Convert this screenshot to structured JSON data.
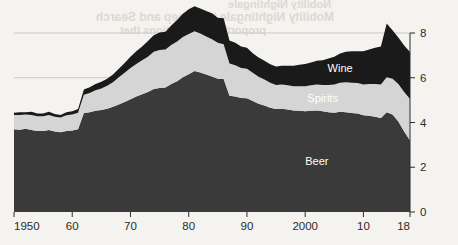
{
  "chart_data": {
    "type": "area",
    "stacked": true,
    "title": "",
    "subtitle": "",
    "xlabel": "",
    "ylabel": "",
    "xlim": [
      1950,
      2018
    ],
    "ylim": [
      0,
      8.6
    ],
    "y_axis_position": "right",
    "grid": "horizontal-faint",
    "gridlines": [
      6,
      8
    ],
    "legend_position": "inline-on-areas",
    "x_tick_labels": [
      "1950",
      "60",
      "70",
      "80",
      "90",
      "2000",
      "10",
      "18"
    ],
    "x_tick_values": [
      1950,
      1960,
      1970,
      1980,
      1990,
      2000,
      2010,
      2018
    ],
    "y_tick_labels": [
      "0",
      "2",
      "4",
      "6",
      "8"
    ],
    "y_tick_values": [
      0,
      2,
      4,
      6,
      8
    ],
    "x": [
      1950,
      1951,
      1952,
      1953,
      1954,
      1955,
      1956,
      1957,
      1958,
      1959,
      1960,
      1961,
      1962,
      1963,
      1964,
      1965,
      1966,
      1967,
      1968,
      1969,
      1970,
      1971,
      1972,
      1973,
      1974,
      1975,
      1976,
      1977,
      1978,
      1979,
      1980,
      1981,
      1982,
      1983,
      1984,
      1985,
      1986,
      1987,
      1988,
      1989,
      1990,
      1991,
      1992,
      1993,
      1994,
      1995,
      1996,
      1997,
      1998,
      1999,
      2000,
      2001,
      2002,
      2003,
      2004,
      2005,
      2006,
      2007,
      2008,
      2009,
      2010,
      2011,
      2012,
      2013,
      2014,
      2015,
      2016,
      2017,
      2018
    ],
    "series": [
      {
        "name": "Beer",
        "color": "#3a3a3a",
        "label_color": "#ffffff",
        "values": [
          3.7,
          3.68,
          3.72,
          3.66,
          3.62,
          3.62,
          3.66,
          3.6,
          3.56,
          3.62,
          3.64,
          3.7,
          4.42,
          4.46,
          4.52,
          4.56,
          4.62,
          4.7,
          4.8,
          4.92,
          5.04,
          5.16,
          5.26,
          5.36,
          5.5,
          5.54,
          5.56,
          5.72,
          5.84,
          6.02,
          6.16,
          6.3,
          6.24,
          6.14,
          6.06,
          5.96,
          5.94,
          5.2,
          5.16,
          5.1,
          5.08,
          4.96,
          4.84,
          4.76,
          4.66,
          4.6,
          4.62,
          4.58,
          4.54,
          4.52,
          4.5,
          4.52,
          4.54,
          4.5,
          4.46,
          4.44,
          4.48,
          4.46,
          4.42,
          4.4,
          4.32,
          4.3,
          4.26,
          4.2,
          4.46,
          4.36,
          4.04,
          3.6,
          3.2
        ]
      },
      {
        "name": "Spirits",
        "color": "#d5d5d5",
        "label_color": "#ffffff",
        "values": [
          0.64,
          0.66,
          0.64,
          0.68,
          0.66,
          0.66,
          0.68,
          0.66,
          0.66,
          0.7,
          0.72,
          0.74,
          0.82,
          0.86,
          0.92,
          0.96,
          1.02,
          1.1,
          1.22,
          1.3,
          1.4,
          1.46,
          1.52,
          1.58,
          1.66,
          1.7,
          1.7,
          1.74,
          1.78,
          1.8,
          1.8,
          1.78,
          1.74,
          1.7,
          1.66,
          1.6,
          1.56,
          1.44,
          1.4,
          1.34,
          1.32,
          1.26,
          1.2,
          1.16,
          1.12,
          1.08,
          1.08,
          1.08,
          1.08,
          1.1,
          1.12,
          1.14,
          1.16,
          1.18,
          1.22,
          1.26,
          1.3,
          1.34,
          1.36,
          1.36,
          1.38,
          1.42,
          1.46,
          1.5,
          1.56,
          1.6,
          1.68,
          1.76,
          1.85
        ]
      },
      {
        "name": "Wine",
        "color": "#1a1a1a",
        "label_color": "#ffffff",
        "values": [
          0.1,
          0.12,
          0.1,
          0.14,
          0.12,
          0.12,
          0.14,
          0.12,
          0.12,
          0.14,
          0.14,
          0.16,
          0.24,
          0.26,
          0.28,
          0.3,
          0.32,
          0.34,
          0.38,
          0.44,
          0.5,
          0.56,
          0.62,
          0.7,
          0.74,
          0.78,
          0.8,
          0.88,
          0.96,
          1.04,
          1.1,
          1.12,
          1.12,
          1.14,
          1.16,
          1.12,
          1.16,
          1.02,
          1.0,
          0.96,
          0.94,
          0.88,
          0.86,
          0.84,
          0.82,
          0.82,
          0.84,
          0.88,
          0.92,
          0.96,
          1.0,
          1.02,
          1.06,
          1.1,
          1.18,
          1.24,
          1.3,
          1.36,
          1.4,
          1.42,
          1.48,
          1.54,
          1.62,
          1.7,
          2.4,
          2.16,
          2.08,
          2.08,
          2.1
        ]
      }
    ],
    "totals": [
      4.44,
      4.46,
      4.46,
      4.48,
      4.4,
      4.4,
      4.48,
      4.38,
      4.34,
      4.46,
      4.5,
      4.6,
      5.48,
      5.58,
      5.72,
      5.82,
      5.96,
      6.14,
      6.4,
      6.66,
      6.94,
      7.18,
      7.4,
      7.64,
      7.9,
      8.02,
      8.06,
      8.34,
      8.58,
      8.86,
      9.06,
      9.2,
      9.1,
      8.98,
      8.88,
      8.68,
      8.66,
      7.66,
      7.56,
      7.4,
      7.34,
      7.1,
      6.9,
      6.76,
      6.6,
      6.5,
      6.54,
      6.54,
      6.54,
      6.58,
      6.62,
      6.68,
      6.76,
      6.78,
      6.86,
      6.94,
      7.08,
      7.16,
      7.18,
      7.18,
      7.18,
      7.26,
      7.34,
      7.4,
      8.42,
      8.12,
      7.8,
      7.44,
      7.15
    ]
  },
  "annotations": {
    "wine_label": "Wine",
    "spirits_label": "Spirits",
    "beer_label": "Beer"
  },
  "bleed_through_text": {
    "line1": "Nobility Nightingale",
    "line2": "Mobility Nightingale to Sweep and Search",
    "line3": "proportion implications that",
    "line4": "consistently"
  },
  "colors": {
    "background": "#f4f3f0",
    "beer": "#3a3a3a",
    "spirits": "#d5d5d5",
    "wine": "#1a1a1a",
    "axis": "#2b2b2b",
    "gridline": "#c9c9c9"
  }
}
